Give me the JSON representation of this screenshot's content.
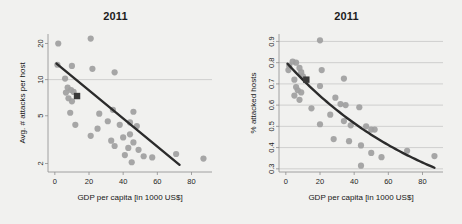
{
  "figure": {
    "background_color": "#f1f1ef",
    "point_color": "#a0a0a0",
    "fit_color": "#2b2b2b",
    "grid_color": "#b9b9b9",
    "axis_color": "#8e8e8e",
    "marker_color": "#3a3a3a"
  },
  "chart_data": [
    {
      "type": "scatter",
      "title": "2011",
      "xlabel": "GDP per capita [in 1000 US$]",
      "ylabel": "Avg. # attacks per host",
      "xlim": [
        -4,
        92
      ],
      "ylim": [
        1.7,
        24
      ],
      "yscale": "log",
      "xticks": [
        0,
        20,
        40,
        60,
        80
      ],
      "xticklabels": [
        "0",
        "20",
        "40",
        "60",
        "80"
      ],
      "yticks": [
        2,
        5,
        10,
        20
      ],
      "yticklabels": [
        "2",
        "5",
        "10",
        "20"
      ],
      "gridlines_y": [
        10
      ],
      "grid": "single horizontal gridline at y=10",
      "legend": "none",
      "points": [
        {
          "x": 2,
          "y": 20.0
        },
        {
          "x": 21,
          "y": 22.0
        },
        {
          "x": 1.5,
          "y": 13.3
        },
        {
          "x": 10,
          "y": 13.0
        },
        {
          "x": 22,
          "y": 12.3
        },
        {
          "x": 35,
          "y": 11.5
        },
        {
          "x": 6,
          "y": 10.2
        },
        {
          "x": 7.5,
          "y": 8.6
        },
        {
          "x": 9.5,
          "y": 8.2
        },
        {
          "x": 6.5,
          "y": 7.8
        },
        {
          "x": 11,
          "y": 7.9
        },
        {
          "x": 8,
          "y": 7.0
        },
        {
          "x": 10,
          "y": 6.6
        },
        {
          "x": 9,
          "y": 5.3
        },
        {
          "x": 26,
          "y": 5.2
        },
        {
          "x": 34,
          "y": 5.6
        },
        {
          "x": 46,
          "y": 5.4
        },
        {
          "x": 12,
          "y": 4.2
        },
        {
          "x": 25,
          "y": 3.9
        },
        {
          "x": 31,
          "y": 4.5
        },
        {
          "x": 38,
          "y": 4.2
        },
        {
          "x": 44,
          "y": 4.4
        },
        {
          "x": 48,
          "y": 4.1
        },
        {
          "x": 21,
          "y": 3.4
        },
        {
          "x": 33,
          "y": 3.1
        },
        {
          "x": 40,
          "y": 3.3
        },
        {
          "x": 44,
          "y": 3.5
        },
        {
          "x": 35,
          "y": 2.8
        },
        {
          "x": 43,
          "y": 2.7
        },
        {
          "x": 46,
          "y": 3.0
        },
        {
          "x": 49,
          "y": 2.6
        },
        {
          "x": 41,
          "y": 2.35
        },
        {
          "x": 45,
          "y": 2.05
        },
        {
          "x": 52,
          "y": 2.3
        },
        {
          "x": 57,
          "y": 2.25
        },
        {
          "x": 71,
          "y": 2.4
        },
        {
          "x": 87,
          "y": 2.2
        }
      ],
      "highlight_point": {
        "x": 13,
        "y": 7.3,
        "shape": "square"
      },
      "fit": {
        "type": "log-linear",
        "x_start": 1,
        "y_start": 13.6,
        "x_end": 73,
        "y_end": 1.95
      }
    },
    {
      "type": "scatter",
      "title": "2011",
      "xlabel": "GDP per capita [in 1000 US$]",
      "ylabel": "% attacked hosts",
      "xlim": [
        -4,
        92
      ],
      "ylim": [
        0.285,
        0.935
      ],
      "yscale": "linear",
      "xticks": [
        0,
        20,
        40,
        60,
        80
      ],
      "xticklabels": [
        "0",
        "20",
        "40",
        "60",
        "80"
      ],
      "yticks": [
        0.3,
        0.4,
        0.5,
        0.6,
        0.7,
        0.8,
        0.9
      ],
      "yticklabels": [
        "0.3",
        "0.4",
        "0.5",
        "0.6",
        "0.7",
        "0.8",
        "0.9"
      ],
      "gridlines_y": [
        0.3,
        0.4,
        0.5,
        0.6,
        0.7,
        0.8,
        0.9
      ],
      "grid": "horizontal gridlines at every 0.1",
      "legend": "none",
      "points": [
        {
          "x": 20,
          "y": 0.905
        },
        {
          "x": 4,
          "y": 0.805
        },
        {
          "x": 6,
          "y": 0.8
        },
        {
          "x": 2,
          "y": 0.785
        },
        {
          "x": 1.5,
          "y": 0.765
        },
        {
          "x": 8,
          "y": 0.775
        },
        {
          "x": 9,
          "y": 0.755
        },
        {
          "x": 21,
          "y": 0.765
        },
        {
          "x": 5,
          "y": 0.72
        },
        {
          "x": 10,
          "y": 0.735
        },
        {
          "x": 20,
          "y": 0.69
        },
        {
          "x": 34,
          "y": 0.725
        },
        {
          "x": 6,
          "y": 0.685
        },
        {
          "x": 7,
          "y": 0.67
        },
        {
          "x": 9,
          "y": 0.66
        },
        {
          "x": 5,
          "y": 0.645
        },
        {
          "x": 8,
          "y": 0.625
        },
        {
          "x": 29,
          "y": 0.635
        },
        {
          "x": 32,
          "y": 0.605
        },
        {
          "x": 35,
          "y": 0.6
        },
        {
          "x": 43,
          "y": 0.59
        },
        {
          "x": 15,
          "y": 0.585
        },
        {
          "x": 26,
          "y": 0.555
        },
        {
          "x": 34,
          "y": 0.525
        },
        {
          "x": 38,
          "y": 0.505
        },
        {
          "x": 20,
          "y": 0.51
        },
        {
          "x": 47,
          "y": 0.5
        },
        {
          "x": 50,
          "y": 0.485
        },
        {
          "x": 52,
          "y": 0.485
        },
        {
          "x": 28,
          "y": 0.44
        },
        {
          "x": 37,
          "y": 0.43
        },
        {
          "x": 44,
          "y": 0.41
        },
        {
          "x": 50,
          "y": 0.375
        },
        {
          "x": 71,
          "y": 0.385
        },
        {
          "x": 56,
          "y": 0.355
        },
        {
          "x": 87,
          "y": 0.36
        },
        {
          "x": 44,
          "y": 0.315
        }
      ],
      "highlight_point": {
        "x": 12,
        "y": 0.72,
        "shape": "square"
      },
      "fit": {
        "type": "decay-curve",
        "x_start": 1,
        "y_start": 0.795,
        "x_end": 87,
        "y_end": 0.305
      }
    }
  ]
}
